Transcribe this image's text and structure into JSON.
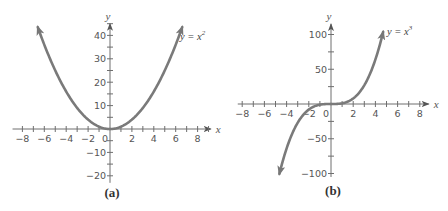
{
  "figure": {
    "colors": {
      "axis": "#6e6e6e",
      "curve": "#7a7a7a",
      "text": "#555555"
    }
  },
  "chart_data": [
    {
      "type": "line",
      "caption": "(a)",
      "title": "",
      "series": [
        {
          "name": "y = x^2",
          "label": "y = x",
          "exponent": "2",
          "function": "x^2",
          "x_range": [
            -6.6,
            6.6
          ]
        }
      ],
      "xlabel": "x",
      "ylabel": "y",
      "xlim": [
        -8.9,
        9.2
      ],
      "ylim": [
        -23,
        45
      ],
      "xticks": [
        -8,
        -6,
        -4,
        -2,
        0,
        2,
        4,
        6,
        8
      ],
      "xtick_labels": [
        "−8",
        "−6",
        "−4",
        "−2",
        "0",
        "2",
        "4",
        "6",
        "8"
      ],
      "xminor_step": 1,
      "yticks": [
        -20,
        -10,
        10,
        20,
        30,
        40
      ],
      "ytick_labels": [
        "−20",
        "−10",
        "10",
        "20",
        "30",
        "40"
      ],
      "yminor_step": 5,
      "grid": false,
      "layout": {
        "origin_px": [
          110,
          129
        ],
        "px_per_x": 10.95,
        "px_per_y": 2.34,
        "label_px": [
          180,
          40
        ],
        "caption_px": [
          112,
          197
        ]
      }
    },
    {
      "type": "line",
      "caption": "(b)",
      "title": "",
      "series": [
        {
          "name": "y = x^3",
          "label": "y = x",
          "exponent": "3",
          "function": "x^3",
          "x_range": [
            -4.65,
            4.7
          ]
        }
      ],
      "xlabel": "x",
      "ylabel": "y",
      "xlim": [
        -8.4,
        8.8
      ],
      "ylim": [
        -105,
        115
      ],
      "xticks": [
        -8,
        -6,
        -4,
        -2,
        0,
        2,
        4,
        6,
        8
      ],
      "xtick_labels": [
        "−8",
        "−6",
        "−4",
        "−2",
        "0",
        "2",
        "4",
        "6",
        "8"
      ],
      "xminor_step": 1,
      "yticks": [
        -100,
        -50,
        50,
        100
      ],
      "ytick_labels": [
        "−100",
        "−50",
        "50",
        "100"
      ],
      "yminor_step": 25,
      "grid": false,
      "layout": {
        "origin_px": [
          331,
          104
        ],
        "px_per_x": 11.1,
        "px_per_y": 0.695,
        "label_px": [
          387,
          35
        ],
        "caption_px": [
          333,
          195
        ]
      }
    }
  ]
}
